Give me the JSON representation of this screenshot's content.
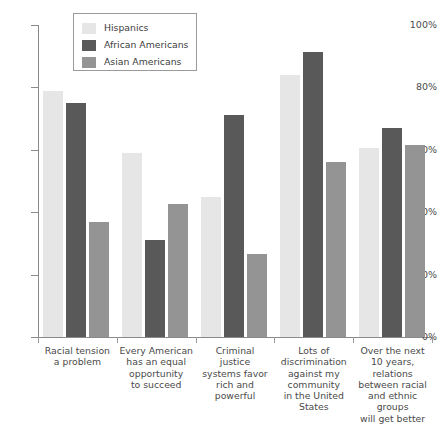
{
  "chart_data": {
    "type": "bar",
    "title": "",
    "subtitle": "",
    "xlabel": "",
    "ylabel": "",
    "ylim": [
      0,
      100
    ],
    "yticks": [
      0,
      20,
      40,
      60,
      80,
      100
    ],
    "ytick_labels": [
      "0%",
      "20%",
      "40%",
      "60%",
      "80%",
      "100%"
    ],
    "grid": false,
    "legend_position": "top-left-inset",
    "categories": [
      "Racial tension a problem",
      "Every American has an equal opportunity to succeed",
      "Criminal justice systems favor rich and powerful",
      "Lots of discrimination against my community in the United States",
      "Over the next 10 years, relations between racial and ethnic groups will get better"
    ],
    "category_label_lines": [
      [
        "Racial tension",
        "a problem"
      ],
      [
        "Every American",
        "has an equal",
        "opportunity",
        "to succeed"
      ],
      [
        "Criminal",
        "justice",
        "systems favor",
        "rich and",
        "powerful"
      ],
      [
        "Lots of",
        "discrimination",
        "against my",
        "community",
        "in the United",
        "States"
      ],
      [
        "Over the next",
        "10 years,",
        "relations",
        "between racial",
        "and ethnic",
        "groups",
        "will get better"
      ]
    ],
    "series": [
      {
        "name": "Hispanics",
        "color": "#e6e6e6",
        "values": [
          79,
          59,
          45,
          84,
          60.5
        ]
      },
      {
        "name": "African Americans",
        "color": "#595959",
        "values": [
          75,
          31,
          71,
          91.5,
          67
        ]
      },
      {
        "name": "Asian Americans",
        "color": "#949494",
        "values": [
          37,
          42.5,
          26.5,
          56,
          61.5
        ]
      }
    ]
  },
  "legend": {
    "items": [
      {
        "label": "Hispanics",
        "color": "#e6e6e6"
      },
      {
        "label": "African Americans",
        "color": "#595959"
      },
      {
        "label": "Asian Americans",
        "color": "#949494"
      }
    ]
  },
  "axis": {
    "y_labels": [
      "100%",
      "80%",
      "60%",
      "40%",
      "20%",
      "0%"
    ]
  }
}
